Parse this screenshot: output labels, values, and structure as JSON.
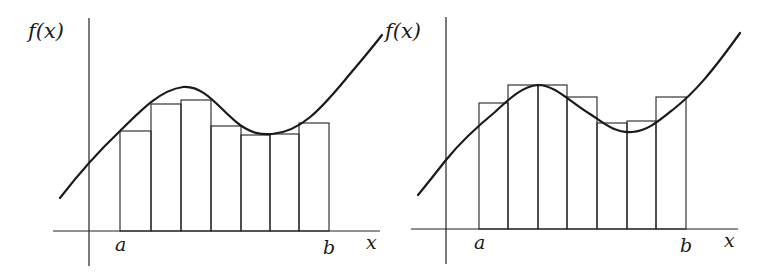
{
  "panels": [
    {
      "id": "left",
      "description": "Riemann sum with left-endpoint style rectangles lying below the curve",
      "ylabel": "f(x)",
      "xlabel": "x",
      "a_label": "a",
      "b_label": "b",
      "origin": [
        89,
        231
      ],
      "yaxis_top": 18,
      "yaxis_bottom": 266,
      "xaxis_left": 53,
      "xaxis_right": 380,
      "partition_x": [
        120,
        151,
        181,
        211,
        241,
        270,
        299,
        329
      ],
      "rect_tops": [
        131,
        104,
        100,
        126,
        135,
        134,
        123
      ],
      "curve_path": "M60,198 C80,172 100,150 120,131 C140,111 160,90 183,87 C205,85 220,110 240,125 C252,133 260,135 272,134 C300,132 320,110 345,80 C360,62 372,48 382,35"
    },
    {
      "id": "right",
      "description": "Riemann sum with rectangles straddling the curve",
      "ylabel": "f(x)",
      "xlabel": "x",
      "a_label": "a",
      "b_label": "b",
      "origin": [
        446,
        229
      ],
      "yaxis_top": 17,
      "yaxis_bottom": 264,
      "xaxis_left": 411,
      "xaxis_right": 738,
      "partition_x": [
        479,
        508,
        538,
        567,
        597,
        627,
        656,
        686
      ],
      "rect_tops": [
        103,
        85,
        85,
        97,
        123,
        121,
        97
      ],
      "curve_path": "M418,195 C428,183 438,170 446,160 C462,140 478,126 495,112 C510,98 523,86 538,85 C555,85 570,102 590,114 C605,124 615,133 632,132 C648,131 660,120 675,108 C695,92 712,72 740,33"
    }
  ],
  "chart_data": {
    "type": "diagram",
    "panels": [
      {
        "name": "left",
        "subintervals": 7,
        "rectangles": "below curve (lower sum style)"
      },
      {
        "name": "right",
        "subintervals": 7,
        "rectangles": "sample points within subintervals (midpoint-like)"
      }
    ],
    "xlabel": "x",
    "ylabel": "f(x)",
    "interval_labels": [
      "a",
      "b"
    ]
  }
}
